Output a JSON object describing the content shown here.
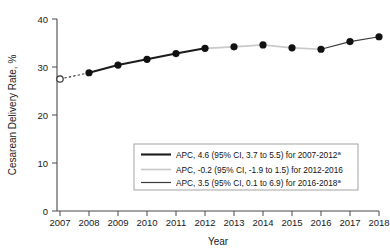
{
  "chart_data": {
    "type": "line",
    "title": "",
    "subtitle": "",
    "xlabel": "Year",
    "ylabel": "Cesarean Delivery Rate, %",
    "x": [
      2007,
      2008,
      2009,
      2010,
      2011,
      2012,
      2013,
      2014,
      2015,
      2016,
      2017,
      2018
    ],
    "xticklabels": [
      "2007",
      "2008",
      "2009",
      "2010",
      "2011",
      "2012",
      "2013",
      "2014",
      "2015",
      "2016",
      "2017",
      "2018"
    ],
    "yticklabels": [
      "0",
      "10",
      "20",
      "30",
      "40"
    ],
    "yticks": [
      0,
      10,
      20,
      30,
      40
    ],
    "xlim": [
      2007,
      2018
    ],
    "ylim": [
      0,
      40
    ],
    "grid": false,
    "legend_position": "lower center inside",
    "series": [
      {
        "name": "Cesarean delivery rate",
        "values": [
          27.5,
          28.8,
          30.4,
          31.6,
          32.8,
          33.9,
          34.2,
          34.6,
          34.0,
          33.7,
          35.3,
          36.3
        ],
        "marker": "circle",
        "marker_open_indices": [
          0
        ],
        "color": "#111111"
      }
    ],
    "segments": [
      {
        "name": "joinpoint-segment-1",
        "range": [
          2007,
          2012
        ],
        "style": "thick-solid-dark",
        "color": "#1c1c1c",
        "dashed_lead_in": [
          2007,
          2008
        ]
      },
      {
        "name": "joinpoint-segment-2",
        "range": [
          2012,
          2016
        ],
        "style": "light-gray-solid",
        "color": "#c9c9c9"
      },
      {
        "name": "joinpoint-segment-3",
        "range": [
          2016,
          2018
        ],
        "style": "thin-solid-dark",
        "color": "#3a3a3a"
      }
    ],
    "legend": [
      {
        "label": "APC, 4.6 (95% CI, 3.7 to 5.5) for 2007-2012",
        "superscript": "a",
        "color": "#1c1c1c",
        "apc": 4.6,
        "ci_low": 3.7,
        "ci_high": 5.5,
        "period": "2007-2012"
      },
      {
        "label": "APC, -0.2 (95% CI, -1.9 to 1.5) for 2012-2016",
        "superscript": "",
        "color": "#c9c9c9",
        "apc": -0.2,
        "ci_low": -1.9,
        "ci_high": 1.5,
        "period": "2012-2016"
      },
      {
        "label": "APC, 3.5 (95% CI, 0.1 to 6.9) for 2016-2018",
        "superscript": "a",
        "color": "#3a3a3a",
        "apc": 3.5,
        "ci_low": 0.1,
        "ci_high": 6.9,
        "period": "2016-2018"
      }
    ]
  }
}
